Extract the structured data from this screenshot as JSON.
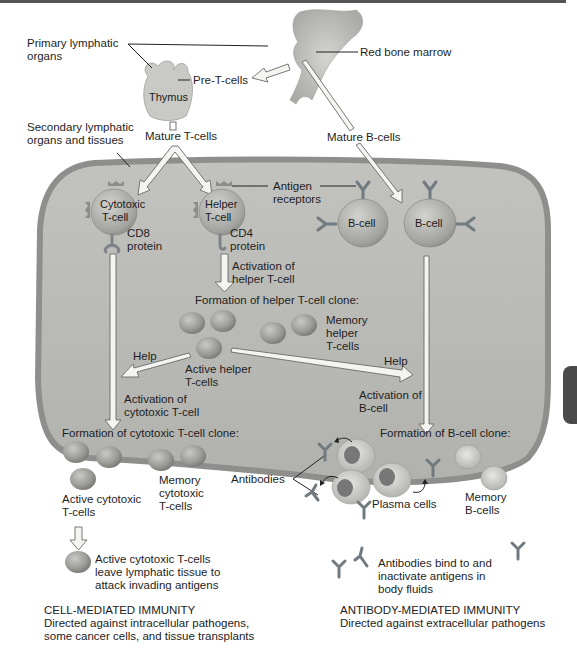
{
  "diagram": {
    "top": {
      "primary_organs": [
        "Primary lymphatic",
        "organs"
      ],
      "red_bone_marrow": "Red bone marrow",
      "thymus": "Thymus",
      "pre_t_cells": "Pre-T-cells",
      "secondary_organs": [
        "Secondary lymphatic",
        "organs and tissues"
      ],
      "mature_t_cells": "Mature T-cells",
      "mature_b_cells": "Mature B-cells"
    },
    "cells": {
      "cytotoxic_t": [
        "Cytotoxic",
        "T-cell"
      ],
      "helper_t": [
        "Helper",
        "T-cell"
      ],
      "b_cell_1": "B-cell",
      "b_cell_2": "B-cell",
      "cd8": [
        "CD8",
        "protein"
      ],
      "cd4": [
        "CD4",
        "protein"
      ],
      "antigen_receptors": [
        "Antigen",
        "receptors"
      ]
    },
    "helper_branch": {
      "activation": [
        "Activation of",
        "helper T-cell"
      ],
      "clone_title": "Formation of helper T-cell clone:",
      "memory": [
        "Memory",
        "helper",
        "T-cells"
      ],
      "active": [
        "Active helper",
        "T-cells"
      ],
      "help_left": "Help",
      "help_right": "Help"
    },
    "cytotoxic_branch": {
      "activation": [
        "Activation of",
        "cytotoxic T-cell"
      ],
      "clone_title": "Formation of cytotoxic T-cell clone:",
      "active": [
        "Active cytotoxic",
        "T-cells"
      ],
      "memory": [
        "Memory",
        "cytotoxic",
        "T-cells"
      ],
      "leave": [
        "Active cytotoxic T-cells",
        "leave lymphatic tissue to",
        "attack invading antigens"
      ]
    },
    "b_branch": {
      "activation": [
        "Activation of",
        "B-cell"
      ],
      "clone_title": "Formation of B-cell clone:",
      "antibodies": "Antibodies",
      "plasma": "Plasma cells",
      "memory": [
        "Memory",
        "B-cells"
      ],
      "bind": [
        "Antibodies bind to and",
        "inactivate antigens in",
        "body fluids"
      ]
    },
    "captions": {
      "cell_mediated": {
        "title": "CELL-MEDIATED IMMUNITY",
        "lines": [
          "Directed against intracellular pathogens,",
          "some cancer cells, and tissue transplants"
        ]
      },
      "antibody_mediated": {
        "title": "ANTIBODY-MEDIATED IMMUNITY",
        "lines": [
          "Directed against extracellular pathogens"
        ]
      }
    },
    "colors": {
      "tissue_fill": "#b9b9b6",
      "tissue_border": "#8e8e8c",
      "cell_fill": "#9c9c9a",
      "arrow_fill": "#f4f4f0",
      "antibody": "#707a80"
    }
  }
}
